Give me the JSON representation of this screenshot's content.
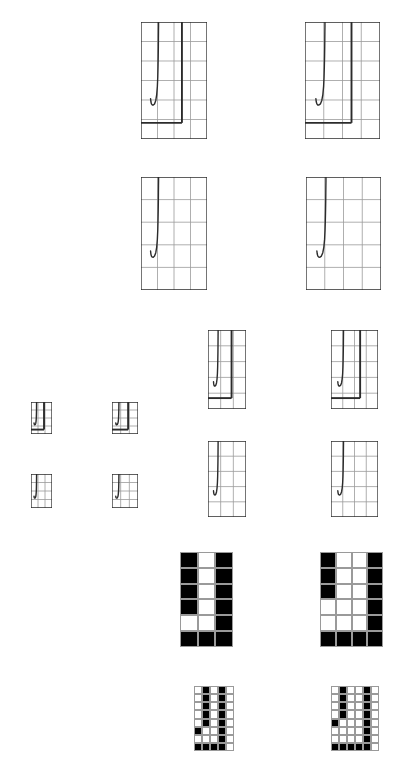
{
  "figure": {
    "title": "",
    "background_color": "#ffffff",
    "curve_color": "#2b2b2b",
    "grid_color": "#9a9a9a",
    "frame_color": "#2b2b2b",
    "fill_color": "#000000"
  },
  "chart_data": {
    "type": "line",
    "title": "",
    "subtitle": "",
    "xlabel": "",
    "ylabel": "",
    "xlim": [
      0,
      1
    ],
    "ylim": [
      0,
      1
    ],
    "grid": true,
    "legend": null,
    "annotations": [],
    "series": [
      {
        "name": "j-curve",
        "comment": "Normalized panel coordinates, x right, y up.",
        "x": [
          0.145,
          0.15,
          0.158,
          0.17,
          0.186,
          0.205,
          0.224,
          0.238,
          0.248,
          0.254,
          0.258,
          0.261,
          0.263,
          0.264,
          0.265,
          0.266,
          0.266
        ],
        "y": [
          0.345,
          0.318,
          0.3,
          0.291,
          0.29,
          0.3,
          0.33,
          0.38,
          0.45,
          0.53,
          0.62,
          0.71,
          0.79,
          0.86,
          0.92,
          0.965,
          1.0
        ]
      },
      {
        "name": "vertical-rule",
        "x": [
          0.62,
          0.62
        ],
        "y": [
          0.138,
          1.0
        ]
      },
      {
        "name": "baseline",
        "x": [
          0.0,
          0.62
        ],
        "y": [
          0.138,
          0.138
        ]
      }
    ],
    "gridlines": {
      "x": [
        0.0,
        0.25,
        0.5,
        0.75,
        1.0
      ],
      "y": [
        0.0,
        0.2,
        0.4,
        0.6,
        0.8,
        1.0
      ]
    }
  },
  "panels": [
    {
      "id": "panel-r1c1",
      "name": "curve-panel-large-narrow",
      "row": 1,
      "col": 1,
      "x": 141,
      "y": 22,
      "w": 66,
      "h": 117,
      "cols": 4,
      "rows": 6,
      "style": "vector",
      "has_curve": true,
      "has_vertical_rule": true,
      "has_baseline": true
    },
    {
      "id": "panel-r1c2",
      "name": "curve-panel-large-wide",
      "row": 1,
      "col": 2,
      "x": 305,
      "y": 22,
      "w": 75,
      "h": 117,
      "cols": 4,
      "rows": 6,
      "style": "vector",
      "has_curve": true,
      "has_vertical_rule": true,
      "has_baseline": true
    },
    {
      "id": "panel-r2c1",
      "name": "curve-panel-plain-narrow",
      "row": 2,
      "col": 1,
      "x": 141,
      "y": 177,
      "w": 66,
      "h": 113,
      "cols": 4,
      "rows": 5,
      "style": "vector",
      "has_curve": true,
      "has_vertical_rule": false,
      "has_baseline": false
    },
    {
      "id": "panel-r2c2",
      "name": "curve-panel-plain-wide",
      "row": 2,
      "col": 2,
      "x": 306,
      "y": 177,
      "w": 75,
      "h": 113,
      "cols": 4,
      "rows": 5,
      "style": "vector",
      "has_curve": true,
      "has_vertical_rule": false,
      "has_baseline": false
    },
    {
      "id": "panel-r3c1",
      "name": "curve-panel-medium-narrow",
      "row": 3,
      "col": 1,
      "x": 208,
      "y": 330,
      "w": 38,
      "h": 79,
      "cols": 3,
      "rows": 5,
      "style": "vector",
      "has_curve": true,
      "has_vertical_rule": true,
      "has_baseline": true
    },
    {
      "id": "panel-r3c2",
      "name": "curve-panel-medium-wide",
      "row": 3,
      "col": 2,
      "x": 331,
      "y": 330,
      "w": 47,
      "h": 79,
      "cols": 4,
      "rows": 5,
      "style": "vector",
      "has_curve": true,
      "has_vertical_rule": true,
      "has_baseline": true
    },
    {
      "id": "panel-r4c1",
      "name": "curve-panel-medium-plain-narrow",
      "row": 4,
      "col": 1,
      "x": 208,
      "y": 441,
      "w": 38,
      "h": 76,
      "cols": 3,
      "rows": 5,
      "style": "vector",
      "has_curve": true,
      "has_vertical_rule": false,
      "has_baseline": false
    },
    {
      "id": "panel-r4c2",
      "name": "curve-panel-medium-plain-wide",
      "row": 4,
      "col": 2,
      "x": 331,
      "y": 441,
      "w": 47,
      "h": 76,
      "cols": 4,
      "rows": 5,
      "style": "vector",
      "has_curve": true,
      "has_vertical_rule": false,
      "has_baseline": false
    },
    {
      "id": "panel-s1c1",
      "name": "curve-panel-tiny-narrow",
      "row": 3,
      "col": 0,
      "x": 31,
      "y": 402,
      "w": 21,
      "h": 32,
      "cols": 3,
      "rows": 4,
      "style": "vector",
      "has_curve": true,
      "has_vertical_rule": true,
      "has_baseline": true
    },
    {
      "id": "panel-s1c2",
      "name": "curve-panel-tiny-wide",
      "row": 3,
      "col": 0,
      "x": 112,
      "y": 402,
      "w": 26,
      "h": 32,
      "cols": 3,
      "rows": 4,
      "style": "vector",
      "has_curve": true,
      "has_vertical_rule": true,
      "has_baseline": true
    },
    {
      "id": "panel-s2c1",
      "name": "curve-panel-tiny-plain-narrow",
      "row": 4,
      "col": 0,
      "x": 31,
      "y": 474,
      "w": 21,
      "h": 34,
      "cols": 3,
      "rows": 4,
      "style": "vector",
      "has_curve": true,
      "has_vertical_rule": false,
      "has_baseline": false
    },
    {
      "id": "panel-s2c2",
      "name": "curve-panel-tiny-plain-wide",
      "row": 4,
      "col": 0,
      "x": 112,
      "y": 474,
      "w": 26,
      "h": 34,
      "cols": 3,
      "rows": 4,
      "style": "vector",
      "has_curve": true,
      "has_vertical_rule": false,
      "has_baseline": false
    }
  ],
  "raster_panels": [
    {
      "id": "raster-r5c1",
      "name": "binarized-panel-coarse-narrow",
      "x": 180,
      "y": 552,
      "w": 53,
      "h": 95,
      "cols": 3,
      "rows": 6,
      "gridlines": true,
      "cells": [
        [
          1,
          0,
          1
        ],
        [
          1,
          0,
          1
        ],
        [
          1,
          0,
          1
        ],
        [
          1,
          0,
          1
        ],
        [
          0,
          0,
          1
        ],
        [
          1,
          1,
          1
        ]
      ]
    },
    {
      "id": "raster-r5c2",
      "name": "binarized-panel-coarse-wide",
      "x": 320,
      "y": 552,
      "w": 63,
      "h": 95,
      "cols": 4,
      "rows": 6,
      "gridlines": true,
      "cells": [
        [
          1,
          0,
          0,
          1
        ],
        [
          1,
          0,
          0,
          1
        ],
        [
          1,
          0,
          0,
          1
        ],
        [
          0,
          0,
          0,
          1
        ],
        [
          0,
          0,
          0,
          1
        ],
        [
          1,
          1,
          1,
          1
        ]
      ]
    },
    {
      "id": "raster-r6c1",
      "name": "binarized-panel-fine-narrow",
      "x": 194,
      "y": 686,
      "w": 40,
      "h": 65,
      "cols": 5,
      "rows": 8,
      "gridlines": true,
      "cells": [
        [
          0,
          1,
          0,
          1,
          0
        ],
        [
          0,
          1,
          0,
          1,
          0
        ],
        [
          0,
          1,
          0,
          1,
          0
        ],
        [
          0,
          1,
          0,
          1,
          0
        ],
        [
          0,
          1,
          0,
          1,
          0
        ],
        [
          1,
          0,
          0,
          1,
          0
        ],
        [
          0,
          0,
          0,
          1,
          0
        ],
        [
          1,
          1,
          1,
          1,
          0
        ]
      ]
    },
    {
      "id": "raster-r6c2",
      "name": "binarized-panel-fine-wide",
      "x": 331,
      "y": 686,
      "w": 48,
      "h": 65,
      "cols": 6,
      "rows": 8,
      "gridlines": true,
      "cells": [
        [
          0,
          1,
          0,
          0,
          1,
          0
        ],
        [
          0,
          1,
          0,
          0,
          1,
          0
        ],
        [
          0,
          1,
          0,
          0,
          1,
          0
        ],
        [
          0,
          1,
          0,
          0,
          1,
          0
        ],
        [
          1,
          0,
          0,
          0,
          1,
          0
        ],
        [
          0,
          0,
          0,
          0,
          1,
          0
        ],
        [
          0,
          0,
          0,
          0,
          1,
          0
        ],
        [
          1,
          1,
          1,
          1,
          1,
          0
        ]
      ]
    }
  ]
}
